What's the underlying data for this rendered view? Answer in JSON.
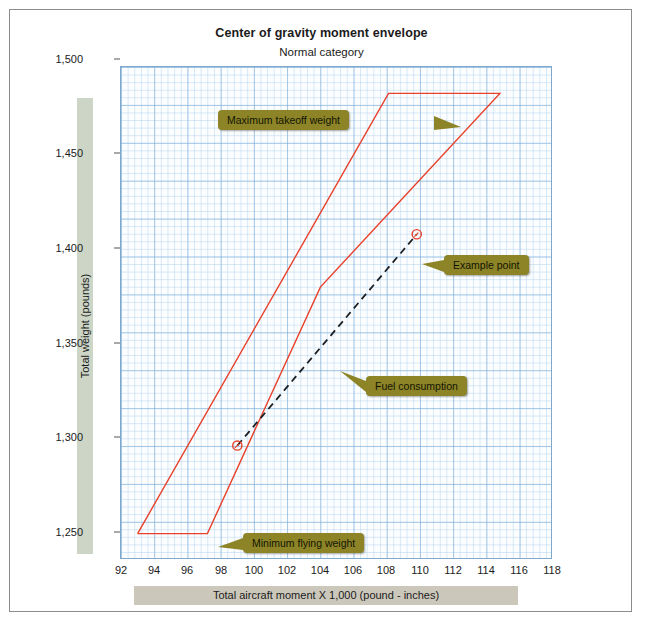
{
  "figure": {
    "title": "Center of gravity moment envelope",
    "subtitle": "Normal category"
  },
  "axes": {
    "ylabel": "Total weight (pounds)",
    "xlabel": "Total aircraft moment X 1,000 (pound - inches)",
    "yticks": [
      "1,250",
      "1,300",
      "1,350",
      "1,400",
      "1,450",
      "1,500"
    ],
    "xticks": [
      "92",
      "94",
      "96",
      "98",
      "100",
      "102",
      "104",
      "106",
      "108",
      "110",
      "112",
      "114",
      "116",
      "118"
    ]
  },
  "callouts": {
    "max_takeoff": "Maximum takeoff weight",
    "example_point": "Example point",
    "fuel_consumption": "Fuel consumption",
    "min_flying": "Minimum flying weight"
  },
  "colors": {
    "envelope": "#e8402a",
    "callout_bg": "#8c8426",
    "grid_major": "#78aad7",
    "grid_minor": "#a0c8e8",
    "ylabel_bar": "#ccd5c6",
    "xlabel_bar": "#cbc8bb",
    "fuel_line": "#1c2024"
  },
  "chart_data": {
    "type": "line",
    "title": "Center of gravity moment envelope",
    "subtitle": "Normal category",
    "xlabel": "Total aircraft moment X 1,000 (pound - inches)",
    "ylabel": "Total weight (pounds)",
    "xlim": [
      92,
      118
    ],
    "ylim": [
      1235,
      1515
    ],
    "xticks": [
      92,
      94,
      96,
      98,
      100,
      102,
      104,
      106,
      108,
      110,
      112,
      114,
      116,
      118
    ],
    "yticks": [
      1250,
      1300,
      1350,
      1400,
      1450,
      1500
    ],
    "grid": true,
    "legend": "none",
    "series": [
      {
        "name": "CG moment envelope",
        "type": "closed-polygon",
        "color": "#e8402a",
        "points": [
          [
            93.0,
            1250
          ],
          [
            108.1,
            1500
          ],
          [
            114.8,
            1500
          ],
          [
            104.0,
            1390
          ],
          [
            97.2,
            1250
          ],
          [
            93.0,
            1250
          ]
        ]
      },
      {
        "name": "Fuel consumption",
        "type": "dashed-line",
        "color": "#1c2024",
        "points": [
          [
            99.0,
            1300
          ],
          [
            109.8,
            1420
          ]
        ]
      }
    ],
    "markers": [
      {
        "name": "example-point-upper",
        "x": 109.8,
        "y": 1420,
        "style": "open-circle",
        "color": "#e8402a"
      },
      {
        "name": "example-point-lower",
        "x": 99.0,
        "y": 1300,
        "style": "open-circle",
        "color": "#e8402a"
      }
    ],
    "annotations": [
      {
        "label": "Maximum takeoff weight",
        "target_x": 108.1,
        "target_y": 1500,
        "side": "left"
      },
      {
        "label": "Example point",
        "target_x": 109.8,
        "target_y": 1420,
        "side": "right"
      },
      {
        "label": "Fuel consumption",
        "target_x": 103.0,
        "target_y": 1350,
        "side": "right"
      },
      {
        "label": "Minimum flying weight",
        "target_x": 97.2,
        "target_y": 1250,
        "side": "right"
      }
    ]
  }
}
